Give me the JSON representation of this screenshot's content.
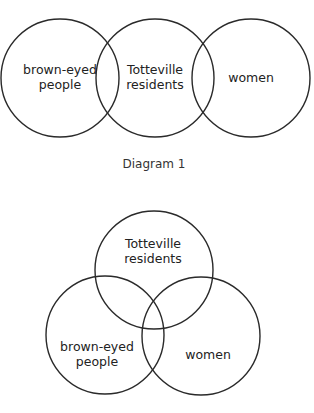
{
  "diagrams": [
    {
      "caption": "Diagram 1",
      "arrangement": "three circles in a row, adjacent pairs overlapping",
      "sets": [
        {
          "id": "brown",
          "lines": [
            "brown-eyed",
            "people"
          ]
        },
        {
          "id": "totteville",
          "lines": [
            "Totteville",
            "residents"
          ]
        },
        {
          "id": "women",
          "lines": [
            "women"
          ]
        }
      ]
    },
    {
      "caption": "",
      "arrangement": "three mutually overlapping circles (triangle)",
      "sets": [
        {
          "id": "totteville",
          "lines": [
            "Totteville",
            "residents"
          ]
        },
        {
          "id": "brown",
          "lines": [
            "brown-eyed",
            "people"
          ]
        },
        {
          "id": "women",
          "lines": [
            "women"
          ]
        }
      ]
    }
  ],
  "colors": {
    "stroke": "#2a2a2a",
    "text": "#222222",
    "background": "#ffffff"
  }
}
